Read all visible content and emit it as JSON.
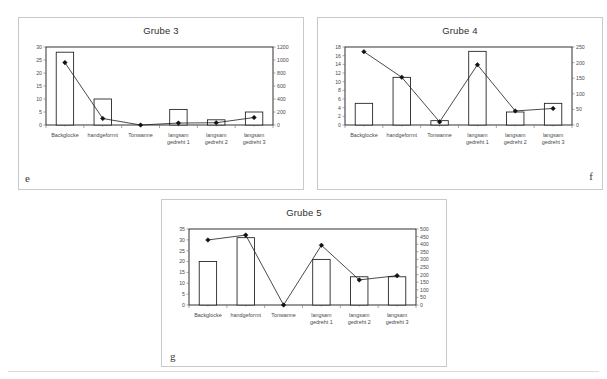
{
  "page": {
    "background_color": "#ffffff",
    "frame_border_color": "#c9c9c9",
    "bottom_rule_color": "#dcdcdc"
  },
  "figure_letters": {
    "e": "e",
    "f": "f",
    "g": "g"
  },
  "chart_data": [
    {
      "id": "e",
      "type": "bar",
      "title": "Grube 3",
      "xlabel": "",
      "ylabel": "",
      "categories": [
        "Backglocke",
        "handgeformt",
        "Tonwanne",
        "langsam gedreht 1",
        "langsam gedreht 2",
        "langsam gedreht 3"
      ],
      "category_lines": [
        [
          "Backglocke"
        ],
        [
          "handgeformt"
        ],
        [
          "Tonwanne"
        ],
        [
          "langsam",
          "gedreht 1"
        ],
        [
          "langsam",
          "gedreht 2"
        ],
        [
          "langsam",
          "gedreht 3"
        ]
      ],
      "series": [
        {
          "name": "bars",
          "axis": "left",
          "type": "bar",
          "values": [
            28,
            10,
            0,
            6,
            2,
            5
          ]
        },
        {
          "name": "line",
          "axis": "right",
          "type": "line",
          "values": [
            960,
            100,
            0,
            30,
            35,
            115
          ]
        }
      ],
      "ylim": [
        0,
        30
      ],
      "yticks": [
        0,
        5,
        10,
        15,
        20,
        25,
        30
      ],
      "ylim_right": [
        0,
        1200
      ],
      "yticks_right": [
        0,
        200,
        400,
        600,
        800,
        1000,
        1200
      ],
      "grid": false,
      "legend": "none"
    },
    {
      "id": "f",
      "type": "bar",
      "title": "Grube 4",
      "xlabel": "",
      "ylabel": "",
      "categories": [
        "Backglocke",
        "handgeformt",
        "Tonwanne",
        "langsam gedreht 1",
        "langsam gedreht 2",
        "langsam gedreht 3"
      ],
      "category_lines": [
        [
          "Backglocke"
        ],
        [
          "handgeformt"
        ],
        [
          "Tonwanne"
        ],
        [
          "langsam",
          "gedreht 1"
        ],
        [
          "langsam",
          "gedreht 2"
        ],
        [
          "langsam",
          "gedreht 3"
        ]
      ],
      "series": [
        {
          "name": "bars",
          "axis": "left",
          "type": "bar",
          "values": [
            5,
            11,
            1,
            17,
            3,
            5
          ]
        },
        {
          "name": "line",
          "axis": "right",
          "type": "line",
          "values": [
            235,
            153,
            10,
            193,
            45,
            53
          ]
        }
      ],
      "ylim": [
        0,
        18
      ],
      "yticks": [
        0,
        2,
        4,
        6,
        8,
        10,
        12,
        14,
        16,
        18
      ],
      "ylim_right": [
        0,
        250
      ],
      "yticks_right": [
        0,
        50,
        100,
        150,
        200,
        250
      ],
      "grid": false,
      "legend": "none"
    },
    {
      "id": "g",
      "type": "bar",
      "title": "Grube 5",
      "xlabel": "",
      "ylabel": "",
      "categories": [
        "Backglocke",
        "handgeformt",
        "Tonwanne",
        "langsam gedreht 1",
        "langsam gedreht 2",
        "langsam gedreht 3"
      ],
      "category_lines": [
        [
          "Backglocke"
        ],
        [
          "handgeformt"
        ],
        [
          "Tonwanne"
        ],
        [
          "langsam",
          "gedreht 1"
        ],
        [
          "langsam",
          "gedreht 2"
        ],
        [
          "langsam",
          "gedreht 3"
        ]
      ],
      "series": [
        {
          "name": "bars",
          "axis": "left",
          "type": "bar",
          "values": [
            20,
            31,
            0,
            21,
            13,
            13
          ]
        },
        {
          "name": "line",
          "axis": "right",
          "type": "line",
          "values": [
            428,
            460,
            0,
            393,
            165,
            193
          ]
        }
      ],
      "ylim": [
        0,
        35
      ],
      "yticks": [
        0,
        5,
        10,
        15,
        20,
        25,
        30,
        35
      ],
      "ylim_right": [
        0,
        500
      ],
      "yticks_right": [
        0,
        50,
        100,
        150,
        200,
        250,
        300,
        350,
        400,
        450,
        500
      ],
      "grid": false,
      "legend": "none"
    }
  ]
}
